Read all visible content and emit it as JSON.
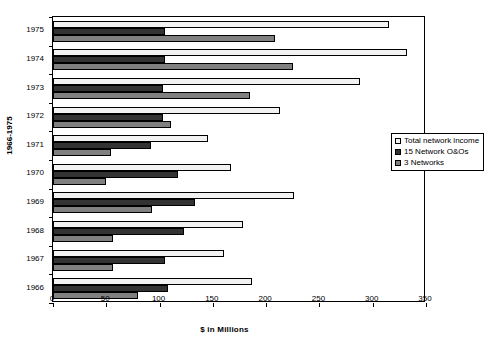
{
  "chart_data": {
    "type": "bar",
    "orientation": "horizontal",
    "title": "",
    "xlabel": "$ in Millions",
    "ylabel": "1966-1975",
    "xlim": [
      0,
      350
    ],
    "xticks": [
      0,
      50,
      100,
      150,
      200,
      250,
      300,
      350
    ],
    "grid": false,
    "legend_position": "upper right",
    "categories": [
      "1975",
      "1974",
      "1973",
      "1972",
      "1971",
      "1970",
      "1969",
      "1968",
      "1967",
      "1966"
    ],
    "series": [
      {
        "name": "Total network income",
        "color": "#F2F2F2",
        "values": [
          315,
          332,
          288,
          213,
          145,
          167,
          226,
          178,
          160,
          187
        ]
      },
      {
        "name": "15 Network O&Os",
        "color": "#333333",
        "values": [
          105,
          105,
          103,
          103,
          92,
          117,
          133,
          123,
          105,
          108
        ]
      },
      {
        "name": "3 Networks",
        "color": "#808080",
        "values": [
          208,
          225,
          185,
          111,
          54,
          50,
          93,
          56,
          56,
          80
        ]
      }
    ]
  },
  "legend": {
    "items": [
      {
        "label": "Total network income",
        "swatch": "#F2F2F2"
      },
      {
        "label": "15 Network O&Os",
        "swatch": "#333333"
      },
      {
        "label": "3 Networks",
        "swatch": "#808080"
      }
    ]
  },
  "axes": {
    "x_title": "$ in Millions",
    "y_title": "1966-1975"
  }
}
